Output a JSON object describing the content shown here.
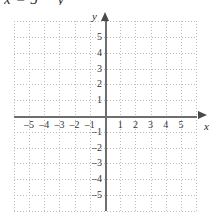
{
  "equation": {
    "text": "x = 5 − y"
  },
  "chart_data": {
    "type": "scatter",
    "title": "",
    "subtitle": "",
    "xlabel": "x",
    "ylabel": "y",
    "xlim": [
      -6,
      6
    ],
    "ylim": [
      -6,
      6
    ],
    "xticks": [
      -5,
      -4,
      -3,
      -2,
      -1,
      1,
      2,
      3,
      4,
      5
    ],
    "yticks": [
      5,
      4,
      3,
      2,
      1,
      -1,
      -2,
      -3,
      -4,
      -5
    ],
    "xtick_labels": [
      "–5",
      "–4",
      "–3",
      "–2",
      "–1",
      "1",
      "2",
      "3",
      "4",
      "5"
    ],
    "ytick_labels": [
      "5",
      "4",
      "3",
      "2",
      "1",
      "–1",
      "–2",
      "–3",
      "–4",
      "–5"
    ],
    "grid": true,
    "grid_style": "dotted",
    "grid_spacing": 1,
    "legend": null,
    "series": [],
    "annotations": [],
    "axis_arrows": true,
    "origin_label": ""
  },
  "colors": {
    "background": "#ffffff",
    "grid": "#bdbdbd",
    "axis": "#6e6e6e",
    "arrow": "#4a4a4a",
    "text": "#343434"
  },
  "axis_names": {
    "x": "x",
    "y": "y"
  }
}
